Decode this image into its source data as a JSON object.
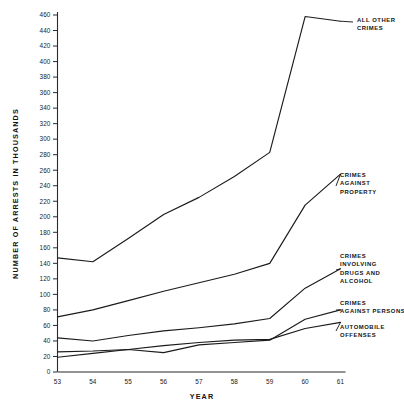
{
  "chart_data": {
    "type": "line",
    "title": "",
    "xlabel": "YEAR",
    "ylabel": "NUMBER OF ARRESTS IN THOUSANDS",
    "x": [
      53,
      54,
      55,
      56,
      57,
      58,
      59,
      60,
      61
    ],
    "xtick_labels": [
      "53",
      "54",
      "55",
      "56",
      "57",
      "58",
      "59",
      "60",
      "61"
    ],
    "ytick_labels": [
      "0",
      "20",
      "40",
      "60",
      "80",
      "100",
      "120",
      "140",
      "160",
      "180",
      "200",
      "220",
      "240",
      "260",
      "280",
      "300",
      "320",
      "340",
      "360",
      "380",
      "400",
      "420",
      "440",
      "460"
    ],
    "ytick_values": [
      0,
      20,
      40,
      60,
      80,
      100,
      120,
      140,
      160,
      180,
      200,
      220,
      240,
      260,
      280,
      300,
      320,
      340,
      360,
      380,
      400,
      420,
      440,
      460
    ],
    "xlim": [
      53,
      61
    ],
    "ylim": [
      0,
      460
    ],
    "grid": false,
    "legend_position": "right-inline-labels",
    "line_color": "#1b1b1b",
    "series": [
      {
        "name": "All Other Crimes",
        "label_lines": [
          "ALL OTHER",
          "CRIMES"
        ],
        "values": [
          147,
          142,
          172,
          203,
          225,
          252,
          283,
          458,
          452
        ]
      },
      {
        "name": "Crimes Against Property",
        "label_lines": [
          "CRIMES",
          "AGAINST",
          "PROPERTY"
        ],
        "values": [
          71,
          80,
          92,
          104,
          115,
          126,
          140,
          215,
          255
        ]
      },
      {
        "name": "Crimes Involving Drugs and Alcohol",
        "label_lines": [
          "CRIMES",
          "INVOLVING",
          "DRUGS AND",
          "ALCOHOL"
        ],
        "values": [
          44,
          40,
          47,
          53,
          57,
          62,
          69,
          108,
          133
        ]
      },
      {
        "name": "Crimes Against Persons",
        "label_lines": [
          "CRIMES",
          "AGAINST PERSONS"
        ],
        "values": [
          26,
          27,
          29,
          25,
          35,
          38,
          41,
          68,
          80
        ]
      },
      {
        "name": "Automobile Offenses",
        "label_lines": [
          "AUTOMOBILE",
          "OFFENSES"
        ],
        "values": [
          19,
          24,
          29,
          34,
          38,
          41,
          42,
          56,
          64
        ]
      }
    ]
  }
}
